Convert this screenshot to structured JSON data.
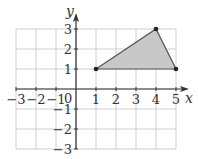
{
  "diagram": {
    "type": "coordinate-plane",
    "x_axis": {
      "label": "x",
      "min": -3,
      "max": 5,
      "ticks": [
        "−3",
        "−2",
        "−1",
        "1",
        "2",
        "3",
        "4",
        "5"
      ]
    },
    "y_axis": {
      "label": "y",
      "min": -3,
      "max": 3,
      "ticks": [
        "3",
        "2",
        "1",
        "−1",
        "−2",
        "−3"
      ]
    },
    "origin_label": "0",
    "triangle": {
      "vertices": [
        [
          1,
          1
        ],
        [
          4,
          3
        ],
        [
          5,
          1
        ]
      ],
      "fill": "#c8c8c8",
      "stroke": "#555555"
    },
    "colors": {
      "grid": "#cfcfcf",
      "axis": "#333333",
      "point": "#222222"
    }
  }
}
